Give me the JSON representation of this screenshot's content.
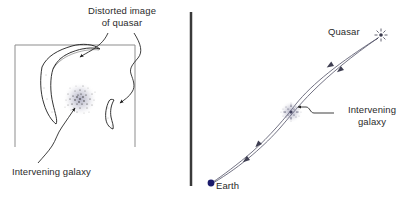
{
  "figure": {
    "type": "gravitational-lensing-diagram",
    "background_color": "#ffffff",
    "panels": 2
  },
  "divider": {
    "name": "vertical-divider-bar",
    "color": "#3a3a3a",
    "x": 191,
    "y_top": 12,
    "y_bottom": 186,
    "width": 2.5
  },
  "left_panel": {
    "title": {
      "line1": "Distorted image",
      "line2": "of quasar"
    },
    "caption": "Intervening galaxy",
    "frame": {
      "name": "image-frame",
      "x": 15,
      "y": 45,
      "width": 120,
      "height": 102,
      "border_color": "#8d8d8d",
      "accent_bottom_left_color": "#e08a5a",
      "accent_bottom_right_color": "#6fb9c4"
    },
    "features": {
      "large_arc_label": "distorted-quasar-arc-large",
      "small_arc_label": "distorted-quasar-arc-small",
      "galaxy_label": "lensing-galaxy-blob",
      "ink_color": "#1d1d1d"
    }
  },
  "right_panel": {
    "quasar_label": "Quasar",
    "galaxy_label_line1": "Intervening",
    "galaxy_label_line2": "galaxy",
    "earth_label": "Earth",
    "markers": {
      "quasar": {
        "x": 381,
        "y": 35,
        "color": "#3c3c4e",
        "glyph": "starburst"
      },
      "galaxy": {
        "x": 291,
        "y": 112,
        "color": "#4a4a6a",
        "glyph": "fuzzy-spiral"
      },
      "earth": {
        "x": 211,
        "y": 183,
        "color": "#1b1b6b",
        "radius": 3.4
      }
    },
    "light_paths": {
      "color": "#5a5a6e",
      "count": 2,
      "description": "curved light rays from quasar bending around galaxy to Earth",
      "arrow_direction": "toward-earth"
    }
  },
  "colors": {
    "text": "#2b2b2b",
    "frame": "#8d8d8d",
    "ray": "#5a5a6e",
    "divider": "#3a3a3a"
  }
}
